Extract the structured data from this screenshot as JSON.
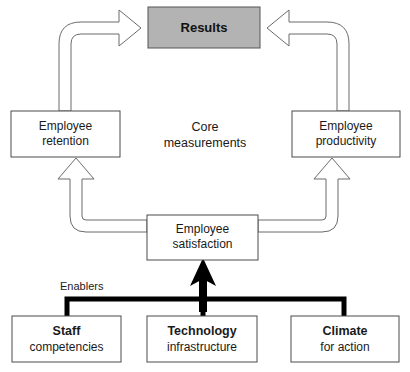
{
  "diagram": {
    "title_box": {
      "label": "Results",
      "fill_color": "#b3b3b3",
      "stroke_color": "#555555"
    },
    "center_label": {
      "line1": "Core",
      "line2": "measurements"
    },
    "enablers_label": "Enablers",
    "core_boxes": [
      {
        "id": "employee-retention",
        "line1": "Employee",
        "line2": "retention",
        "line1_bold": false,
        "line2_bold": false
      },
      {
        "id": "employee-productivity",
        "line1": "Employee",
        "line2": "productivity",
        "line1_bold": false,
        "line2_bold": false
      },
      {
        "id": "employee-satisfaction",
        "line1": "Employee",
        "line2": "satisfaction",
        "line1_bold": false,
        "line2_bold": false
      }
    ],
    "enabler_boxes": [
      {
        "id": "staff-competencies",
        "line1": "Staff",
        "line2": "competencies"
      },
      {
        "id": "technology-infrastructure",
        "line1": "Technology",
        "line2": "infrastructure"
      },
      {
        "id": "climate-for-action",
        "line1": "Climate",
        "line2": "for action"
      }
    ],
    "colors": {
      "box_stroke": "#4a4a4a",
      "box_fill": "#ffffff",
      "arrow_stroke": "#6b6b6b",
      "arrow_fill": "#ffffff",
      "bracket": "#000000",
      "text": "#1a1a1a",
      "results_fill": "#b3b3b3"
    }
  }
}
